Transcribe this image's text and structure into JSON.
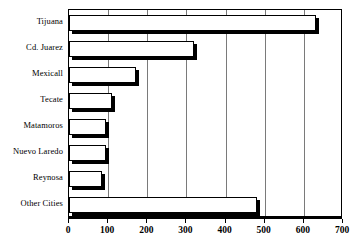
{
  "chart_data": {
    "type": "bar",
    "orientation": "horizontal",
    "title": "",
    "subtitle": "",
    "xlabel": "",
    "ylabel": "",
    "categories": [
      "Tijuana",
      "Cd. Juarez",
      "Mexicall",
      "Tecate",
      "Matamoros",
      "Nuevo Laredo",
      "Reynosa",
      "Other Cities"
    ],
    "values": [
      630,
      320,
      170,
      110,
      95,
      95,
      85,
      480
    ],
    "series": [
      {
        "name": "",
        "values": [
          630,
          320,
          170,
          110,
          95,
          95,
          85,
          480
        ]
      }
    ],
    "xlim": [
      0,
      700
    ],
    "ylim": [
      0,
      8
    ],
    "xticks": [
      0,
      100,
      200,
      300,
      400,
      500,
      600,
      700
    ],
    "xtick_labels": [
      "0",
      "100",
      "200",
      "300",
      "400",
      "500",
      "600",
      "700"
    ],
    "grid": true,
    "grid_axis": "x",
    "legend": false,
    "legend_position": "none",
    "bar_fill_color": "#ffffff",
    "bar_edge_color": "#000000",
    "bar_shadow_color": "#000000",
    "gridline_color": "#7a7a7a",
    "frame_color": "#000000",
    "background_color": "#ffffff"
  },
  "axis": {
    "x_ticks": [
      {
        "value": 0,
        "label": "0"
      },
      {
        "value": 100,
        "label": "100"
      },
      {
        "value": 200,
        "label": "200"
      },
      {
        "value": 300,
        "label": "300"
      },
      {
        "value": 400,
        "label": "400"
      },
      {
        "value": 500,
        "label": "500"
      },
      {
        "value": 600,
        "label": "600"
      },
      {
        "value": 700,
        "label": "700"
      }
    ]
  },
  "categories": [
    {
      "label": "Tijuana",
      "value": 630
    },
    {
      "label": "Cd. Juarez",
      "value": 320
    },
    {
      "label": "Mexicall",
      "value": 170
    },
    {
      "label": "Tecate",
      "value": 110
    },
    {
      "label": "Matamoros",
      "value": 95
    },
    {
      "label": "Nuevo Laredo",
      "value": 95
    },
    {
      "label": "Reynosa",
      "value": 85
    },
    {
      "label": "Other Cities",
      "value": 480
    }
  ]
}
